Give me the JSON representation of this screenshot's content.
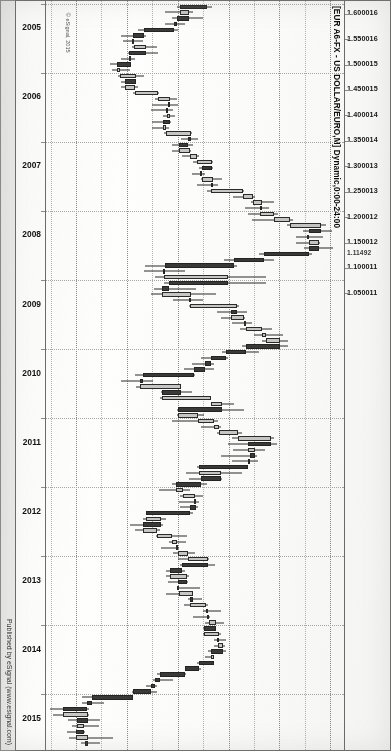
{
  "meta": {
    "orientation_deg": 90,
    "source_note": "scanned print of an eSignal chart window, rotated sideways"
  },
  "chart_title": "[EUR A6-FX - US DOLLAR/EURO,M] Dynamic,0:00-24:00",
  "watermark": "© eSignal, 2015",
  "credit": "Published by eSignal (www.esignal.com)",
  "price_axis": {
    "ticks": [
      "1.600016",
      "1.550016",
      "1.500015",
      "1.450015",
      "1.400014",
      "1.350014",
      "1.300013",
      "1.250013",
      "1.200012",
      "1.150012",
      "1.100011",
      "1.050011"
    ],
    "current_price_label": "1.11492"
  },
  "time_axis": {
    "ticks": [
      "2005",
      "2006",
      "2007",
      "2008",
      "2009",
      "2010",
      "2011",
      "2012",
      "2013",
      "2014",
      "2015"
    ]
  },
  "chart_data": {
    "type": "candlestick",
    "title": "[EUR A6-FX - US DOLLAR/EURO,M] Dynamic,0:00-24:00",
    "subtitle": "Published by eSignal (www.esignal.com)",
    "instrument": "EUR A6-FX - US DOLLAR/EURO",
    "interval": "Monthly (M)",
    "session": "0:00-24:00",
    "xlabel": "",
    "ylabel": "",
    "x": [
      "2005",
      "2006",
      "2007",
      "2008",
      "2009",
      "2010",
      "2011",
      "2012",
      "2013",
      "2014",
      "2015"
    ],
    "xlim": [
      "2005-01",
      "2015-09"
    ],
    "ylim": [
      1.035,
      1.625
    ],
    "ytick_values": [
      1.600016,
      1.550016,
      1.500015,
      1.450015,
      1.400014,
      1.350014,
      1.300013,
      1.250013,
      1.200012,
      1.150012,
      1.100011,
      1.050011
    ],
    "grid": "dotted both axes",
    "legend": "none",
    "current_price": 1.11492,
    "up_color": "#c9c9c7",
    "down_color": "#3a3a3a",
    "outline_color": "#2b2b2b",
    "candles": [
      {
        "t": "2005-01",
        "o": 1.355,
        "h": 1.365,
        "l": 1.296,
        "c": 1.303
      },
      {
        "t": "2005-02",
        "o": 1.303,
        "h": 1.329,
        "l": 1.273,
        "c": 1.32
      },
      {
        "t": "2005-03",
        "o": 1.32,
        "h": 1.348,
        "l": 1.287,
        "c": 1.296
      },
      {
        "t": "2005-04",
        "o": 1.296,
        "h": 1.313,
        "l": 1.273,
        "c": 1.29
      },
      {
        "t": "2005-05",
        "o": 1.29,
        "h": 1.298,
        "l": 1.219,
        "c": 1.232
      },
      {
        "t": "2005-06",
        "o": 1.232,
        "h": 1.236,
        "l": 1.187,
        "c": 1.21
      },
      {
        "t": "2005-07",
        "o": 1.21,
        "h": 1.23,
        "l": 1.19,
        "c": 1.212
      },
      {
        "t": "2005-08",
        "o": 1.212,
        "h": 1.258,
        "l": 1.209,
        "c": 1.235
      },
      {
        "t": "2005-09",
        "o": 1.235,
        "h": 1.259,
        "l": 1.201,
        "c": 1.203
      },
      {
        "t": "2005-10",
        "o": 1.203,
        "h": 1.214,
        "l": 1.187,
        "c": 1.206
      },
      {
        "t": "2005-11",
        "o": 1.206,
        "h": 1.207,
        "l": 1.164,
        "c": 1.179
      },
      {
        "t": "2005-12",
        "o": 1.179,
        "h": 1.204,
        "l": 1.168,
        "c": 1.184
      },
      {
        "t": "2006-01",
        "o": 1.184,
        "h": 1.232,
        "l": 1.18,
        "c": 1.215
      },
      {
        "t": "2006-02",
        "o": 1.215,
        "h": 1.214,
        "l": 1.186,
        "c": 1.194
      },
      {
        "t": "2006-03",
        "o": 1.194,
        "h": 1.22,
        "l": 1.187,
        "c": 1.213
      },
      {
        "t": "2006-04",
        "o": 1.213,
        "h": 1.262,
        "l": 1.21,
        "c": 1.26
      },
      {
        "t": "2006-05",
        "o": 1.26,
        "h": 1.297,
        "l": 1.253,
        "c": 1.283
      },
      {
        "t": "2006-06",
        "o": 1.283,
        "h": 1.298,
        "l": 1.248,
        "c": 1.279
      },
      {
        "t": "2006-07",
        "o": 1.279,
        "h": 1.288,
        "l": 1.246,
        "c": 1.276
      },
      {
        "t": "2006-08",
        "o": 1.276,
        "h": 1.293,
        "l": 1.269,
        "c": 1.282
      },
      {
        "t": "2006-09",
        "o": 1.282,
        "h": 1.284,
        "l": 1.248,
        "c": 1.269
      },
      {
        "t": "2006-10",
        "o": 1.269,
        "h": 1.28,
        "l": 1.248,
        "c": 1.274
      },
      {
        "t": "2006-11",
        "o": 1.274,
        "h": 1.327,
        "l": 1.27,
        "c": 1.325
      },
      {
        "t": "2006-12",
        "o": 1.325,
        "h": 1.337,
        "l": 1.305,
        "c": 1.319
      },
      {
        "t": "2007-01",
        "o": 1.319,
        "h": 1.329,
        "l": 1.286,
        "c": 1.3
      },
      {
        "t": "2007-02",
        "o": 1.3,
        "h": 1.325,
        "l": 1.287,
        "c": 1.323
      },
      {
        "t": "2007-03",
        "o": 1.323,
        "h": 1.34,
        "l": 1.307,
        "c": 1.336
      },
      {
        "t": "2007-04",
        "o": 1.336,
        "h": 1.368,
        "l": 1.329,
        "c": 1.365
      },
      {
        "t": "2007-05",
        "o": 1.365,
        "h": 1.368,
        "l": 1.339,
        "c": 1.345
      },
      {
        "t": "2007-06",
        "o": 1.345,
        "h": 1.352,
        "l": 1.326,
        "c": 1.346
      },
      {
        "t": "2007-07",
        "o": 1.346,
        "h": 1.385,
        "l": 1.344,
        "c": 1.368
      },
      {
        "t": "2007-08",
        "o": 1.368,
        "h": 1.378,
        "l": 1.336,
        "c": 1.363
      },
      {
        "t": "2007-09",
        "o": 1.363,
        "h": 1.428,
        "l": 1.356,
        "c": 1.427
      },
      {
        "t": "2007-10",
        "o": 1.427,
        "h": 1.45,
        "l": 1.407,
        "c": 1.446
      },
      {
        "t": "2007-11",
        "o": 1.446,
        "h": 1.487,
        "l": 1.442,
        "c": 1.464
      },
      {
        "t": "2007-12",
        "o": 1.464,
        "h": 1.477,
        "l": 1.431,
        "c": 1.459
      },
      {
        "t": "2008-01",
        "o": 1.459,
        "h": 1.495,
        "l": 1.437,
        "c": 1.487
      },
      {
        "t": "2008-02",
        "o": 1.487,
        "h": 1.524,
        "l": 1.444,
        "c": 1.519
      },
      {
        "t": "2008-03",
        "o": 1.519,
        "h": 1.59,
        "l": 1.512,
        "c": 1.58
      },
      {
        "t": "2008-04",
        "o": 1.58,
        "h": 1.601,
        "l": 1.544,
        "c": 1.556
      },
      {
        "t": "2008-05",
        "o": 1.556,
        "h": 1.583,
        "l": 1.53,
        "c": 1.556
      },
      {
        "t": "2008-06",
        "o": 1.556,
        "h": 1.577,
        "l": 1.53,
        "c": 1.575
      },
      {
        "t": "2008-07",
        "o": 1.575,
        "h": 1.604,
        "l": 1.546,
        "c": 1.557
      },
      {
        "t": "2008-08",
        "o": 1.557,
        "h": 1.563,
        "l": 1.457,
        "c": 1.468
      },
      {
        "t": "2008-09",
        "o": 1.468,
        "h": 1.487,
        "l": 1.388,
        "c": 1.408
      },
      {
        "t": "2008-10",
        "o": 1.408,
        "h": 1.415,
        "l": 1.233,
        "c": 1.272
      },
      {
        "t": "2008-11",
        "o": 1.272,
        "h": 1.312,
        "l": 1.232,
        "c": 1.27
      },
      {
        "t": "2008-12",
        "o": 1.27,
        "h": 1.472,
        "l": 1.254,
        "c": 1.397
      },
      {
        "t": "2009-01",
        "o": 1.397,
        "h": 1.472,
        "l": 1.271,
        "c": 1.28
      },
      {
        "t": "2009-02",
        "o": 1.28,
        "h": 1.333,
        "l": 1.251,
        "c": 1.268
      },
      {
        "t": "2009-03",
        "o": 1.268,
        "h": 1.374,
        "l": 1.246,
        "c": 1.325
      },
      {
        "t": "2009-04",
        "o": 1.325,
        "h": 1.347,
        "l": 1.288,
        "c": 1.323
      },
      {
        "t": "2009-05",
        "o": 1.323,
        "h": 1.418,
        "l": 1.321,
        "c": 1.415
      },
      {
        "t": "2009-06",
        "o": 1.415,
        "h": 1.434,
        "l": 1.375,
        "c": 1.403
      },
      {
        "t": "2009-07",
        "o": 1.403,
        "h": 1.43,
        "l": 1.383,
        "c": 1.428
      },
      {
        "t": "2009-08",
        "o": 1.428,
        "h": 1.445,
        "l": 1.404,
        "c": 1.433
      },
      {
        "t": "2009-09",
        "o": 1.433,
        "h": 1.484,
        "l": 1.421,
        "c": 1.463
      },
      {
        "t": "2009-10",
        "o": 1.463,
        "h": 1.506,
        "l": 1.448,
        "c": 1.472
      },
      {
        "t": "2009-11",
        "o": 1.472,
        "h": 1.514,
        "l": 1.463,
        "c": 1.5
      },
      {
        "t": "2009-12",
        "o": 1.5,
        "h": 1.514,
        "l": 1.425,
        "c": 1.433
      },
      {
        "t": "2010-01",
        "o": 1.433,
        "h": 1.458,
        "l": 1.386,
        "c": 1.393
      },
      {
        "t": "2010-02",
        "o": 1.393,
        "h": 1.397,
        "l": 1.344,
        "c": 1.363
      },
      {
        "t": "2010-03",
        "o": 1.363,
        "h": 1.369,
        "l": 1.327,
        "c": 1.352
      },
      {
        "t": "2010-04",
        "o": 1.352,
        "h": 1.369,
        "l": 1.31,
        "c": 1.329
      },
      {
        "t": "2010-05",
        "o": 1.329,
        "h": 1.332,
        "l": 1.214,
        "c": 1.23
      },
      {
        "t": "2010-06",
        "o": 1.23,
        "h": 1.249,
        "l": 1.187,
        "c": 1.223
      },
      {
        "t": "2010-07",
        "o": 1.223,
        "h": 1.305,
        "l": 1.215,
        "c": 1.305
      },
      {
        "t": "2010-08",
        "o": 1.305,
        "h": 1.326,
        "l": 1.266,
        "c": 1.268
      },
      {
        "t": "2010-09",
        "o": 1.268,
        "h": 1.364,
        "l": 1.264,
        "c": 1.363
      },
      {
        "t": "2010-10",
        "o": 1.363,
        "h": 1.408,
        "l": 1.369,
        "c": 1.386
      },
      {
        "t": "2010-11",
        "o": 1.386,
        "h": 1.428,
        "l": 1.296,
        "c": 1.299
      },
      {
        "t": "2010-12",
        "o": 1.299,
        "h": 1.349,
        "l": 1.297,
        "c": 1.338
      },
      {
        "t": "2011-01",
        "o": 1.338,
        "h": 1.377,
        "l": 1.287,
        "c": 1.37
      },
      {
        "t": "2011-02",
        "o": 1.37,
        "h": 1.384,
        "l": 1.343,
        "c": 1.38
      },
      {
        "t": "2011-03",
        "o": 1.38,
        "h": 1.425,
        "l": 1.375,
        "c": 1.416
      },
      {
        "t": "2011-04",
        "o": 1.416,
        "h": 1.488,
        "l": 1.405,
        "c": 1.481
      },
      {
        "t": "2011-05",
        "o": 1.481,
        "h": 1.494,
        "l": 1.396,
        "c": 1.436
      },
      {
        "t": "2011-06",
        "o": 1.436,
        "h": 1.47,
        "l": 1.407,
        "c": 1.449
      },
      {
        "t": "2011-07",
        "o": 1.449,
        "h": 1.454,
        "l": 1.383,
        "c": 1.44
      },
      {
        "t": "2011-08",
        "o": 1.44,
        "h": 1.455,
        "l": 1.405,
        "c": 1.437
      },
      {
        "t": "2011-09",
        "o": 1.437,
        "h": 1.425,
        "l": 1.336,
        "c": 1.339
      },
      {
        "t": "2011-10",
        "o": 1.339,
        "h": 1.425,
        "l": 1.314,
        "c": 1.384
      },
      {
        "t": "2011-11",
        "o": 1.384,
        "h": 1.386,
        "l": 1.321,
        "c": 1.344
      },
      {
        "t": "2011-12",
        "o": 1.344,
        "h": 1.355,
        "l": 1.286,
        "c": 1.295
      },
      {
        "t": "2012-01",
        "o": 1.295,
        "h": 1.322,
        "l": 1.262,
        "c": 1.308
      },
      {
        "t": "2012-02",
        "o": 1.308,
        "h": 1.348,
        "l": 1.302,
        "c": 1.332
      },
      {
        "t": "2012-03",
        "o": 1.332,
        "h": 1.339,
        "l": 1.3,
        "c": 1.334
      },
      {
        "t": "2012-04",
        "o": 1.334,
        "h": 1.338,
        "l": 1.302,
        "c": 1.323
      },
      {
        "t": "2012-05",
        "o": 1.323,
        "h": 1.329,
        "l": 1.236,
        "c": 1.236
      },
      {
        "t": "2012-06",
        "o": 1.236,
        "h": 1.274,
        "l": 1.229,
        "c": 1.266
      },
      {
        "t": "2012-07",
        "o": 1.266,
        "h": 1.269,
        "l": 1.204,
        "c": 1.23
      },
      {
        "t": "2012-08",
        "o": 1.23,
        "h": 1.264,
        "l": 1.213,
        "c": 1.258
      },
      {
        "t": "2012-09",
        "o": 1.258,
        "h": 1.317,
        "l": 1.256,
        "c": 1.286
      },
      {
        "t": "2012-10",
        "o": 1.286,
        "h": 1.314,
        "l": 1.28,
        "c": 1.296
      },
      {
        "t": "2012-11",
        "o": 1.296,
        "h": 1.301,
        "l": 1.266,
        "c": 1.299
      },
      {
        "t": "2012-12",
        "o": 1.299,
        "h": 1.331,
        "l": 1.288,
        "c": 1.319
      },
      {
        "t": "2013-01",
        "o": 1.319,
        "h": 1.359,
        "l": 1.299,
        "c": 1.358
      },
      {
        "t": "2013-02",
        "o": 1.358,
        "h": 1.371,
        "l": 1.302,
        "c": 1.307
      },
      {
        "t": "2013-03",
        "o": 1.307,
        "h": 1.313,
        "l": 1.274,
        "c": 1.282
      },
      {
        "t": "2013-04",
        "o": 1.282,
        "h": 1.32,
        "l": 1.274,
        "c": 1.317
      },
      {
        "t": "2013-05",
        "o": 1.317,
        "h": 1.319,
        "l": 1.279,
        "c": 1.299
      },
      {
        "t": "2013-06",
        "o": 1.299,
        "h": 1.342,
        "l": 1.298,
        "c": 1.301
      },
      {
        "t": "2013-07",
        "o": 1.301,
        "h": 1.329,
        "l": 1.275,
        "c": 1.328
      },
      {
        "t": "2013-08",
        "o": 1.328,
        "h": 1.345,
        "l": 1.318,
        "c": 1.322
      },
      {
        "t": "2013-09",
        "o": 1.322,
        "h": 1.357,
        "l": 1.311,
        "c": 1.353
      },
      {
        "t": "2013-10",
        "o": 1.353,
        "h": 1.383,
        "l": 1.348,
        "c": 1.358
      },
      {
        "t": "2013-11",
        "o": 1.358,
        "h": 1.361,
        "l": 1.329,
        "c": 1.359
      },
      {
        "t": "2013-12",
        "o": 1.359,
        "h": 1.389,
        "l": 1.352,
        "c": 1.374
      },
      {
        "t": "2014-01",
        "o": 1.374,
        "h": 1.37,
        "l": 1.348,
        "c": 1.349
      },
      {
        "t": "2014-02",
        "o": 1.349,
        "h": 1.383,
        "l": 1.347,
        "c": 1.38
      },
      {
        "t": "2014-03",
        "o": 1.38,
        "h": 1.393,
        "l": 1.37,
        "c": 1.377
      },
      {
        "t": "2014-04",
        "o": 1.377,
        "h": 1.39,
        "l": 1.37,
        "c": 1.387
      },
      {
        "t": "2014-05",
        "o": 1.387,
        "h": 1.393,
        "l": 1.358,
        "c": 1.363
      },
      {
        "t": "2014-06",
        "o": 1.363,
        "h": 1.37,
        "l": 1.352,
        "c": 1.369
      },
      {
        "t": "2014-07",
        "o": 1.369,
        "h": 1.37,
        "l": 1.336,
        "c": 1.339
      },
      {
        "t": "2014-08",
        "o": 1.339,
        "h": 1.344,
        "l": 1.313,
        "c": 1.313
      },
      {
        "t": "2014-09",
        "o": 1.313,
        "h": 1.315,
        "l": 1.257,
        "c": 1.263
      },
      {
        "t": "2014-10",
        "o": 1.263,
        "h": 1.289,
        "l": 1.25,
        "c": 1.253
      },
      {
        "t": "2014-11",
        "o": 1.253,
        "h": 1.258,
        "l": 1.236,
        "c": 1.245
      },
      {
        "t": "2014-12",
        "o": 1.245,
        "h": 1.257,
        "l": 1.209,
        "c": 1.21
      },
      {
        "t": "2015-01",
        "o": 1.21,
        "h": 1.211,
        "l": 1.11,
        "c": 1.129
      },
      {
        "t": "2015-02",
        "o": 1.129,
        "h": 1.153,
        "l": 1.109,
        "c": 1.119
      },
      {
        "t": "2015-03",
        "o": 1.119,
        "h": 1.124,
        "l": 1.046,
        "c": 1.073
      },
      {
        "t": "2015-04",
        "o": 1.073,
        "h": 1.123,
        "l": 1.052,
        "c": 1.122
      },
      {
        "t": "2015-05",
        "o": 1.122,
        "h": 1.146,
        "l": 1.082,
        "c": 1.099
      },
      {
        "t": "2015-06",
        "o": 1.099,
        "h": 1.144,
        "l": 1.09,
        "c": 1.114
      },
      {
        "t": "2015-07",
        "o": 1.114,
        "h": 1.115,
        "l": 1.081,
        "c": 1.098
      },
      {
        "t": "2015-08",
        "o": 1.098,
        "h": 1.171,
        "l": 1.085,
        "c": 1.121
      },
      {
        "t": "2015-09",
        "o": 1.121,
        "h": 1.146,
        "l": 1.108,
        "c": 1.1149
      }
    ]
  }
}
